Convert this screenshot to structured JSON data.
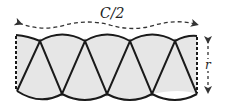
{
  "diagram": {
    "width_label": "C/2",
    "height_label": "r",
    "colors": {
      "fill": "#e6e6e6",
      "stroke": "#1a1a1a",
      "dashed": "#333333"
    },
    "sector_count": 8
  }
}
